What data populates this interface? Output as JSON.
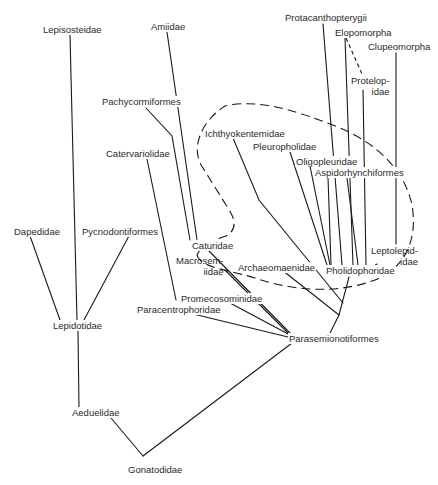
{
  "diagram": {
    "type": "phylogenetic-tree",
    "line_color": "#1a1a1a",
    "text_color": "#2a2a2a",
    "taxa": [
      {
        "id": "lepisosteidae",
        "label": "Lepisosteidae",
        "x": 42,
        "y": 24
      },
      {
        "id": "amiidae",
        "label": "Amiidae",
        "x": 150,
        "y": 21
      },
      {
        "id": "protacanthopterygii",
        "label": "Protacanthopterygii",
        "x": 284,
        "y": 12
      },
      {
        "id": "elopomorpha",
        "label": "Elopomorpha",
        "x": 334,
        "y": 27
      },
      {
        "id": "clupeomorpha",
        "label": "Clupeomorpha",
        "x": 367,
        "y": 41
      },
      {
        "id": "protelopidae",
        "label": "Protelop-\nidae",
        "x": 350,
        "y": 75,
        "multi": true,
        "align": "right"
      },
      {
        "id": "pachycormiformes",
        "label": "Pachycormiformes",
        "x": 101,
        "y": 96
      },
      {
        "id": "ichthyokentemidae",
        "label": "Ichthyokentemidae",
        "x": 204,
        "y": 128
      },
      {
        "id": "pleuropholidae",
        "label": "Pleuropholidae",
        "x": 252,
        "y": 141
      },
      {
        "id": "oligopleuridae",
        "label": "Oligopleuridae",
        "x": 295,
        "y": 156
      },
      {
        "id": "aspidorhynchiformes",
        "label": "Aspidorhynchiformes",
        "x": 314,
        "y": 167
      },
      {
        "id": "catervariolidae",
        "label": "Catervariolidae",
        "x": 105,
        "y": 148
      },
      {
        "id": "dapedidae",
        "label": "Dapedidae",
        "x": 13,
        "y": 226
      },
      {
        "id": "pycnodontiformes",
        "label": "Pycnodontiformes",
        "x": 81,
        "y": 226
      },
      {
        "id": "caturidae",
        "label": "Caturidae",
        "x": 191,
        "y": 240
      },
      {
        "id": "macrosemiidae",
        "label": "Macrosem-\niidae",
        "x": 175,
        "y": 255,
        "multi": true,
        "align": "right"
      },
      {
        "id": "archaeomaenidae",
        "label": "Archaeomaenidae",
        "x": 237,
        "y": 262
      },
      {
        "id": "leptolepididae",
        "label": "Leptolepid-\nidae",
        "x": 370,
        "y": 245,
        "multi": true,
        "align": "right"
      },
      {
        "id": "pholidophoridae",
        "label": "Pholidophoridae",
        "x": 325,
        "y": 265
      },
      {
        "id": "promecosominidae",
        "label": "Promecosominidae",
        "x": 180,
        "y": 293
      },
      {
        "id": "paracentrophoridae",
        "label": "Paracentrophoridae",
        "x": 136,
        "y": 304
      },
      {
        "id": "lepidotidae",
        "label": "Lepidotidae",
        "x": 52,
        "y": 320
      },
      {
        "id": "parasemionotiformes",
        "label": "Parasemionotiformes",
        "x": 288,
        "y": 333
      },
      {
        "id": "aeduelidae",
        "label": "Aeduelidae",
        "x": 71,
        "y": 407
      },
      {
        "id": "gonatodidae",
        "label": "Gonatodidae",
        "x": 127,
        "y": 464
      }
    ],
    "edges": [
      {
        "from": "lepisosteidae",
        "d": "M70 35 L77 320"
      },
      {
        "from": "dapedidae",
        "d": "M30 236 L60 320"
      },
      {
        "from": "pycnodontiformes",
        "d": "M130 234 L84 320"
      },
      {
        "from": "lepidotidae",
        "d": "M78 331 L79 409"
      },
      {
        "from": "aeduelidae",
        "d": "M111 418 L143 456"
      },
      {
        "from": "gonatodidae",
        "d": "M143 456 L292 343"
      },
      {
        "from": "amiidae",
        "d": "M167 32 L197 240"
      },
      {
        "from": "pachycormiformes",
        "d": "M146 108 L172 136 L190 240"
      },
      {
        "from": "catervariolidae",
        "d": "M147 159 L176 300"
      },
      {
        "from": "caturidae",
        "d": "M208 250 L290 333"
      },
      {
        "from": "macrosemiidae",
        "d": "M225 270 L290 335"
      },
      {
        "from": "promecosominidae",
        "d": "M230 303 L290 335"
      },
      {
        "from": "paracentrophoridae",
        "d": "M185 312 L288 337"
      },
      {
        "from": "archaeomaenidae",
        "d": "M282 270 L339 315"
      },
      {
        "from": "ichthyokentemidae",
        "d": "M233 138 L259 200 L343 303"
      },
      {
        "from": "pleuropholidae",
        "d": "M290 152 L327 265"
      },
      {
        "from": "oligopleuridae",
        "d": "M310 166 L330 265"
      },
      {
        "from": "aspidorhynchiformes",
        "d": "M328 177 L331 265"
      },
      {
        "from": "protacanthopterygii",
        "d": "M323 24 L342 265"
      },
      {
        "from": "elopomorpha",
        "d": "M345 38 L353 265"
      },
      {
        "from": "protelopidae",
        "d": "M363 90 L366 265"
      },
      {
        "from": "aspidorhynchiformes-b",
        "d": "M347 178 L358 265"
      },
      {
        "from": "clupeomorpha",
        "d": "M396 53 L396 244"
      },
      {
        "from": "leptolepididae",
        "d": "M377 264 L368 270"
      },
      {
        "from": "pholidophoridae",
        "d": "M349 277 L339 315 L330 333"
      }
    ],
    "dashed_edges": [
      {
        "from": "elopomorpha-protelopidae",
        "d": "M346 38 L362 74"
      }
    ],
    "grouping_outline": {
      "style": "dashed",
      "d": "M197 255 C202 244 212 241 226 236 C240 228 233 215 226 205 L203 168 C190 150 200 122 225 106 C260 98 300 112 340 128 C380 145 405 172 412 205 C418 240 405 268 375 280 C335 295 290 290 255 278 C230 270 200 268 197 255 Z"
    }
  }
}
